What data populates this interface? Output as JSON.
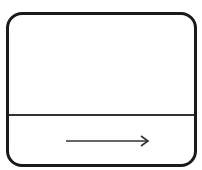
{
  "diagram": {
    "type": "panel-with-arrow",
    "panel": {
      "shape": "rounded-rectangle",
      "stroke_color": "#1a1a1a",
      "fill_color": "#ffffff"
    },
    "divider": {
      "orientation": "horizontal",
      "color": "#333333"
    },
    "arrow": {
      "direction": "right",
      "color": "#333333"
    }
  }
}
